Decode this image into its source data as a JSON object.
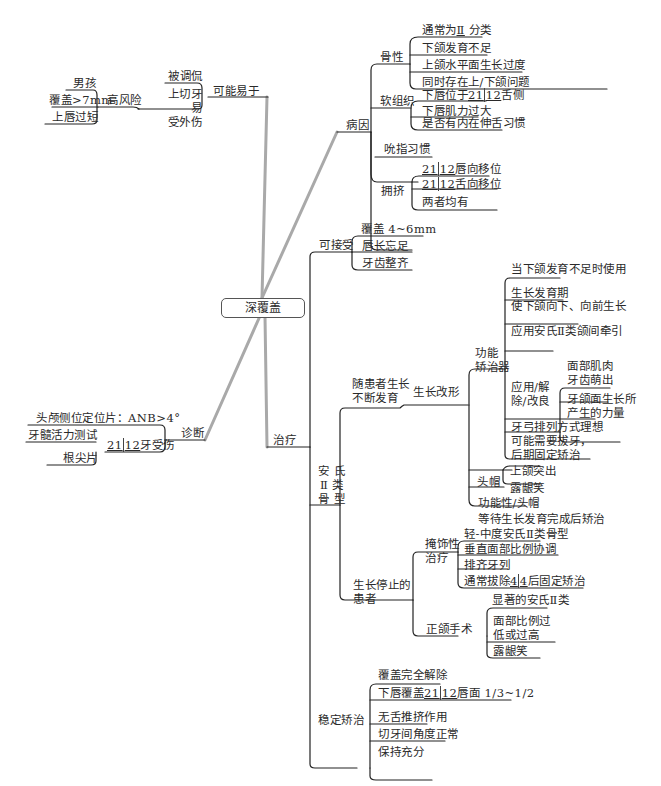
{
  "central": {
    "label": "深覆盖"
  },
  "left": {
    "prone": {
      "label": "可能易于",
      "children": [
        {
          "label": "被调侃"
        },
        {
          "label": "上切牙易受外伤",
          "line1": "上切牙易",
          "line2": "受外伤",
          "children": [
            {
              "label": "高风险",
              "children": [
                {
                  "label": "男孩"
                },
                {
                  "label": "覆盖>7mm"
                },
                {
                  "label": "上唇过短"
                }
              ]
            }
          ]
        }
      ]
    },
    "diagnosis": {
      "label": "诊断",
      "children": [
        {
          "label": "头颅侧位定位片：ANB>4°"
        },
        {
          "label": "21|12牙受伤",
          "teeth_left": "21",
          "teeth_right": "12",
          "suffix": "牙受伤",
          "children": [
            {
              "label": "牙髓活力测试"
            },
            {
              "label": "根尖片"
            }
          ]
        }
      ]
    }
  },
  "right": {
    "etiology": {
      "label": "病因",
      "children": [
        {
          "label": "骨性",
          "children": [
            {
              "label": "通常为Ⅱ分类",
              "text": "通常为",
              "roman": "Ⅱ",
              "after": "分类"
            },
            {
              "label": "下颌发育不足"
            },
            {
              "label": "上颌水平面生长过度"
            },
            {
              "label": "同时存在上/下颌问题"
            }
          ]
        },
        {
          "label": "软组织",
          "children": [
            {
              "label": "下唇位于21|12舌侧",
              "pre": "下唇位于",
              "tl": "21",
              "tr": "12",
              "post": "舌侧"
            },
            {
              "label": "下唇肌力过大"
            },
            {
              "label": "是否有内在伸舌习惯"
            }
          ]
        },
        {
          "label": "吮指习惯"
        },
        {
          "label": "拥挤",
          "children": [
            {
              "label": "21|12唇向移位",
              "tl": "21",
              "tr": "12",
              "post": "唇向移位"
            },
            {
              "label": "21|12舌向移位",
              "tl": "21",
              "tr": "12",
              "post": "舌向移位"
            },
            {
              "label": "两者均有"
            }
          ]
        }
      ]
    },
    "treatment": {
      "label": "治疗",
      "acceptable": {
        "label": "可接受",
        "children": [
          {
            "label": "覆盖 4~6mm"
          },
          {
            "label": "唇长忘足"
          },
          {
            "label": "牙齿整齐"
          }
        ]
      },
      "class2": {
        "label": "安氏Ⅱ类骨型",
        "line1": "安 氏",
        "line2": "Ⅱ 类",
        "line3": "骨 型",
        "growing": {
          "label": "随患者生长不断发育",
          "line1": "随患者生长",
          "line2": "不断发育",
          "modification": {
            "label": "生长改形",
            "functional": {
              "label": "功能矫治器",
              "line1": "功能",
              "line2": "矫治器",
              "children": [
                {
                  "label": "当下颌发育不足时使用"
                },
                {
                  "label": "生长发育期"
                },
                {
                  "label": "使下颌向下、向前生长"
                },
                {
                  "label": "应用安氏Ⅱ类颌间牵引"
                },
                {
                  "label": "应用/解除/改良",
                  "line1": "应用/解",
                  "line2": "除/改良",
                  "children": [
                    {
                      "label": "面部肌肉"
                    },
                    {
                      "label": "牙齿萌出"
                    },
                    {
                      "label": "牙颌面生长所产生的力量",
                      "line1": "牙颌面生长所",
                      "line2": "产生的力量"
                    }
                  ]
                },
                {
                  "label": "牙弓排列方式理想"
                },
                {
                  "label": "可能需要拔牙，后期固定矫治",
                  "line1": "可能需要拔牙，",
                  "line2": "后期固定矫治"
                }
              ]
            },
            "headgear": {
              "label": "头帽",
              "children": [
                {
                  "label": "上颌突出"
                },
                {
                  "label": "露龈笑"
                }
              ]
            },
            "functional_headgear": {
              "label": "功能性/头帽"
            },
            "wait": {
              "label": "等待生长发育完成后矫治"
            }
          }
        },
        "stopped": {
          "label": "生长停止的患者",
          "line1": "生长停止的",
          "line2": "患者",
          "camouflage": {
            "label": "掩饰性治疗",
            "line1": "掩饰性",
            "line2": "治疗",
            "children": [
              {
                "label": "轻-中度安氏Ⅱ类骨型"
              },
              {
                "label": "垂直面部比例协调"
              },
              {
                "label": "排齐牙列"
              },
              {
                "label": "通常拔除4|4后固定矫治",
                "pre": "通常拔除",
                "tl": "4",
                "tr": "4",
                "post": "后固定矫治"
              }
            ]
          },
          "surgery": {
            "label": "正颌手术",
            "children": [
              {
                "label": "显著的安氏Ⅱ类"
              },
              {
                "label": "面部比例过低或过高",
                "line1": "面部比例过",
                "line2": "低或过高"
              },
              {
                "label": "露龈笑"
              }
            ]
          }
        }
      },
      "stable": {
        "label": "稳定矫治",
        "children": [
          {
            "label": "覆盖完全解除"
          },
          {
            "label": "下唇覆盖21|12唇面 1/3~1/2",
            "pre": "下唇覆盖",
            "tl": "21",
            "tr": "12",
            "post": "唇面 1/3~1/2"
          },
          {
            "label": "无舌推挤作用"
          },
          {
            "label": "切牙间角度正常"
          },
          {
            "label": "保持充分"
          }
        ]
      }
    }
  }
}
